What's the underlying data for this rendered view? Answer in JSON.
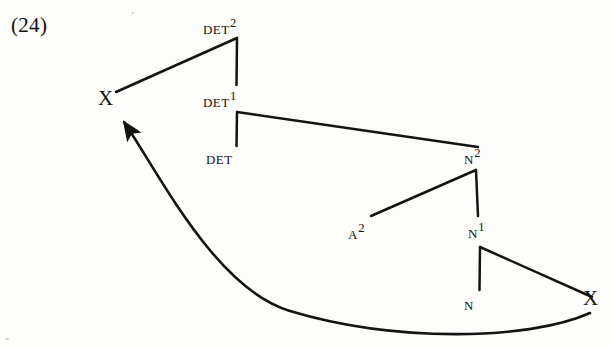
{
  "figure": {
    "example_number": "(24)",
    "domain_kind": "syntax-tree-diagram",
    "ink_color": "#141312",
    "background_color": "#fdfdfc"
  },
  "nodes": [
    {
      "id": "det2",
      "base": "DET",
      "bar": "2",
      "style": "cat",
      "x": 203,
      "y": 17,
      "label": "DET2"
    },
    {
      "id": "x_left",
      "base": "X",
      "bar": "",
      "style": "xnode",
      "x": 98,
      "y": 88,
      "label": "X"
    },
    {
      "id": "det1",
      "base": "DET",
      "bar": "1",
      "style": "cat",
      "x": 203,
      "y": 90,
      "label": "DET1"
    },
    {
      "id": "det0",
      "base": "DET",
      "bar": "",
      "style": "cat",
      "x": 206,
      "y": 148,
      "label": "DET"
    },
    {
      "id": "n2",
      "base": "N",
      "bar": "2",
      "style": "cat",
      "x": 464,
      "y": 147,
      "label": "N2"
    },
    {
      "id": "a2",
      "base": "A",
      "bar": "2",
      "style": "cat",
      "x": 348,
      "y": 222,
      "label": "A2"
    },
    {
      "id": "n1",
      "base": "N",
      "bar": "1",
      "style": "cat",
      "x": 468,
      "y": 221,
      "label": "N1"
    },
    {
      "id": "n0",
      "base": "N",
      "bar": "",
      "style": "cat",
      "x": 464,
      "y": 294,
      "label": "N"
    },
    {
      "id": "x_right",
      "base": "X",
      "bar": "",
      "style": "xnode",
      "x": 583,
      "y": 288,
      "label": "X"
    }
  ],
  "branches": [
    {
      "name": "det2-to-x-left",
      "from": "det2",
      "to": "x_left",
      "kind": "diagonal"
    },
    {
      "name": "det2-to-det1",
      "from": "det2",
      "to": "det1",
      "kind": "vertical"
    },
    {
      "name": "det1-to-det",
      "from": "det1",
      "to": "det0",
      "kind": "vertical"
    },
    {
      "name": "det1-to-n2",
      "from": "det1",
      "to": "n2",
      "kind": "diagonal"
    },
    {
      "name": "n2-to-a2",
      "from": "n2",
      "to": "a2",
      "kind": "diagonal"
    },
    {
      "name": "n2-to-n1",
      "from": "n2",
      "to": "n1",
      "kind": "vertical"
    },
    {
      "name": "n1-to-n",
      "from": "n1",
      "to": "n0",
      "kind": "vertical"
    },
    {
      "name": "n1-to-x-right",
      "from": "n1",
      "to": "x_right",
      "kind": "diagonal"
    }
  ],
  "movement_arrow": {
    "name": "movement-arc",
    "from": "x_right",
    "to": "x_left",
    "direction": "right-to-left",
    "shape": "curved-arc-below",
    "has_arrowhead": true
  }
}
